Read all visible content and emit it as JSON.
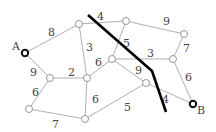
{
  "diagram": {
    "type": "weighted-graph-cut",
    "nodes": [
      {
        "id": "A",
        "x": 25,
        "y": 53,
        "label": "A",
        "terminal": true
      },
      {
        "id": "n1",
        "x": 79,
        "y": 24
      },
      {
        "id": "n2",
        "x": 126,
        "y": 21
      },
      {
        "id": "n3",
        "x": 184,
        "y": 34
      },
      {
        "id": "n4",
        "x": 50,
        "y": 78
      },
      {
        "id": "n5",
        "x": 87,
        "y": 78
      },
      {
        "id": "n6",
        "x": 112,
        "y": 59
      },
      {
        "id": "n7",
        "x": 173,
        "y": 59
      },
      {
        "id": "n8",
        "x": 29,
        "y": 109
      },
      {
        "id": "n9",
        "x": 85,
        "y": 119
      },
      {
        "id": "n10",
        "x": 146,
        "y": 83
      },
      {
        "id": "B",
        "x": 193,
        "y": 104,
        "label": "B",
        "terminal": true
      }
    ],
    "edges": [
      {
        "from": "A",
        "to": "n1",
        "weight": "8"
      },
      {
        "from": "A",
        "to": "n4",
        "weight": "9"
      },
      {
        "from": "n1",
        "to": "n2",
        "weight": "4"
      },
      {
        "from": "n1",
        "to": "n5",
        "weight": "3"
      },
      {
        "from": "n2",
        "to": "n3",
        "weight": "9"
      },
      {
        "from": "n2",
        "to": "n6",
        "weight": "5"
      },
      {
        "from": "n3",
        "to": "n7",
        "weight": "7"
      },
      {
        "from": "n6",
        "to": "n7",
        "weight": "3"
      },
      {
        "from": "n4",
        "to": "n5",
        "weight": "2"
      },
      {
        "from": "n5",
        "to": "n6",
        "weight": "6"
      },
      {
        "from": "n4",
        "to": "n8",
        "weight": "6"
      },
      {
        "from": "n8",
        "to": "n9",
        "weight": "7"
      },
      {
        "from": "n5",
        "to": "n9",
        "weight": "6"
      },
      {
        "from": "n6",
        "to": "n10",
        "weight": "9"
      },
      {
        "from": "n9",
        "to": "n10",
        "weight": "5"
      },
      {
        "from": "n10",
        "to": "B",
        "weight": "4"
      },
      {
        "from": "n7",
        "to": "B",
        "weight": "6"
      }
    ],
    "cut_line": [
      [
        88,
        15
      ],
      [
        152,
        71
      ],
      [
        166,
        112
      ]
    ]
  }
}
